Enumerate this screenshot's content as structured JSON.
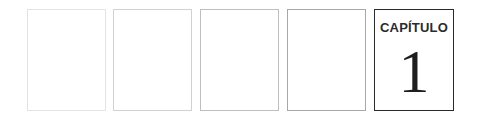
{
  "pages": [
    {
      "id": 1,
      "content": ""
    },
    {
      "id": 2,
      "content": ""
    },
    {
      "id": 3,
      "content": ""
    },
    {
      "id": 4,
      "content": ""
    },
    {
      "id": 5,
      "label": "CAPÍTULO",
      "number": "1"
    }
  ],
  "chapter": {
    "label": "CAPÍTULO",
    "number": "1"
  },
  "colors": {
    "page_border_1": "#e3e3e3",
    "page_border_2": "#d2d2d2",
    "page_border_3": "#bfbfbf",
    "page_border_4": "#a8a8a8",
    "active_border": "#2a2a2a",
    "text": "#2b2b2b"
  }
}
